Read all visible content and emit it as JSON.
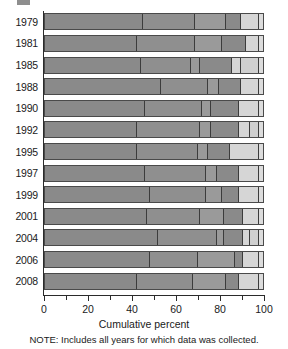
{
  "chart_data": {
    "type": "bar",
    "orientation": "horizontal",
    "stacked": true,
    "title": "",
    "xlabel": "Cumulative percent",
    "ylabel": "",
    "xlim": [
      0,
      100
    ],
    "xticks": [
      0,
      20,
      40,
      60,
      80,
      100
    ],
    "xtick_labels": [
      "0",
      "20",
      "40",
      "60",
      "80",
      "100"
    ],
    "minor_xticks": [
      10,
      30,
      50,
      70,
      90
    ],
    "grid": false,
    "legend": "none",
    "note": "NOTE: Includes all years for which data was collected.",
    "categories": [
      "1979",
      "1981",
      "1985",
      "1988",
      "1990",
      "1992",
      "1995",
      "1997",
      "1999",
      "2001",
      "2004",
      "2006",
      "2008"
    ],
    "segment_colors": [
      "#8a8a8a",
      "#8a8a8a",
      "#8a8a8a",
      "#8a8a8a",
      "#cfcfcf",
      "#d8d8d8"
    ],
    "cumulative_boundaries": [
      [
        45,
        69,
        83,
        90,
        98
      ],
      [
        42,
        69,
        81,
        92,
        98
      ],
      [
        44,
        67,
        71,
        86,
        90,
        98
      ],
      [
        53,
        75,
        80,
        90,
        98
      ],
      [
        46,
        72,
        76,
        89,
        98
      ],
      [
        42,
        71,
        76,
        89,
        94,
        98
      ],
      [
        42,
        70,
        75,
        85,
        98
      ],
      [
        46,
        74,
        79,
        89,
        98
      ],
      [
        48,
        74,
        81,
        89,
        98
      ],
      [
        47,
        71,
        82,
        91,
        98
      ],
      [
        52,
        79,
        82,
        91,
        94,
        98
      ],
      [
        48,
        70,
        87,
        91,
        98
      ],
      [
        42,
        68,
        83,
        89,
        98
      ]
    ],
    "series": [
      {
        "name": "1979",
        "cumulative": [
          45,
          69,
          83,
          90,
          98
        ],
        "segments": [
          45,
          24,
          14,
          7,
          8
        ],
        "colors": [
          "#8a8a8a",
          "#8f8f8f",
          "#9a9a9a",
          "#8a8a8a",
          "#d6d6d6"
        ]
      },
      {
        "name": "1981",
        "cumulative": [
          42,
          69,
          81,
          92,
          98
        ],
        "segments": [
          42,
          27,
          12,
          11,
          6
        ],
        "colors": [
          "#8a8a8a",
          "#8f8f8f",
          "#9a9a9a",
          "#8a8a8a",
          "#d6d6d6"
        ]
      },
      {
        "name": "1985",
        "cumulative": [
          44,
          67,
          71,
          86,
          90,
          98
        ],
        "segments": [
          44,
          23,
          4,
          15,
          4,
          8
        ],
        "colors": [
          "#8a8a8a",
          "#8f8f8f",
          "#9a9a9a",
          "#8a8a8a",
          "#d6d6d6",
          "#cfcfcf"
        ]
      },
      {
        "name": "1988",
        "cumulative": [
          53,
          75,
          80,
          90,
          98
        ],
        "segments": [
          53,
          22,
          5,
          10,
          8
        ],
        "colors": [
          "#8a8a8a",
          "#8f8f8f",
          "#9a9a9a",
          "#8a8a8a",
          "#d6d6d6"
        ]
      },
      {
        "name": "1990",
        "cumulative": [
          46,
          72,
          76,
          89,
          98
        ],
        "segments": [
          46,
          26,
          4,
          13,
          9
        ],
        "colors": [
          "#8a8a8a",
          "#8f8f8f",
          "#9a9a9a",
          "#8a8a8a",
          "#d6d6d6"
        ]
      },
      {
        "name": "1992",
        "cumulative": [
          42,
          71,
          76,
          89,
          94,
          98
        ],
        "segments": [
          42,
          29,
          5,
          13,
          5,
          4
        ],
        "colors": [
          "#8a8a8a",
          "#8f8f8f",
          "#9a9a9a",
          "#8a8a8a",
          "#d6d6d6",
          "#cfcfcf"
        ]
      },
      {
        "name": "1995",
        "cumulative": [
          42,
          70,
          75,
          85,
          98
        ],
        "segments": [
          42,
          28,
          5,
          10,
          13
        ],
        "colors": [
          "#8a8a8a",
          "#8f8f8f",
          "#9a9a9a",
          "#8a8a8a",
          "#d6d6d6"
        ]
      },
      {
        "name": "1997",
        "cumulative": [
          46,
          74,
          79,
          89,
          98
        ],
        "segments": [
          46,
          28,
          5,
          10,
          9
        ],
        "colors": [
          "#8a8a8a",
          "#8f8f8f",
          "#9a9a9a",
          "#8a8a8a",
          "#d6d6d6"
        ]
      },
      {
        "name": "1999",
        "cumulative": [
          48,
          74,
          81,
          89,
          98
        ],
        "segments": [
          48,
          26,
          7,
          8,
          9
        ],
        "colors": [
          "#8a8a8a",
          "#8f8f8f",
          "#9a9a9a",
          "#8a8a8a",
          "#d6d6d6"
        ]
      },
      {
        "name": "2001",
        "cumulative": [
          47,
          71,
          82,
          91,
          98
        ],
        "segments": [
          47,
          24,
          11,
          9,
          7
        ],
        "colors": [
          "#8a8a8a",
          "#8f8f8f",
          "#9a9a9a",
          "#8a8a8a",
          "#d6d6d6"
        ]
      },
      {
        "name": "2004",
        "cumulative": [
          52,
          79,
          82,
          91,
          94,
          98
        ],
        "segments": [
          52,
          27,
          3,
          9,
          3,
          4
        ],
        "colors": [
          "#8a8a8a",
          "#8f8f8f",
          "#9a9a9a",
          "#8a8a8a",
          "#d6d6d6",
          "#cfcfcf"
        ]
      },
      {
        "name": "2006",
        "cumulative": [
          48,
          70,
          87,
          91,
          98
        ],
        "segments": [
          48,
          22,
          17,
          4,
          7
        ],
        "colors": [
          "#8a8a8a",
          "#8f8f8f",
          "#9a9a9a",
          "#8a8a8a",
          "#d6d6d6"
        ]
      },
      {
        "name": "2008",
        "cumulative": [
          42,
          68,
          83,
          89,
          98
        ],
        "segments": [
          42,
          26,
          15,
          6,
          9
        ],
        "colors": [
          "#8a8a8a",
          "#8f8f8f",
          "#9a9a9a",
          "#8a8a8a",
          "#d6d6d6"
        ]
      }
    ]
  },
  "axis": {
    "xlabel": "Cumulative percent",
    "ticks": [
      "0",
      "20",
      "40",
      "60",
      "80",
      "100"
    ]
  },
  "footer": {
    "note": "NOTE: Includes all years for which data was collected."
  }
}
